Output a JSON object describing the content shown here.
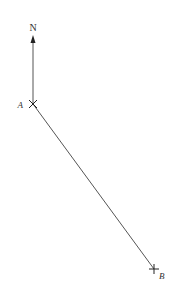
{
  "diagram": {
    "north_label": "N",
    "point_a_label": "A",
    "point_b_label": "B",
    "colors": {
      "line": "#444444",
      "background": "#ffffff"
    },
    "points": {
      "north_tip": [
        33,
        36
      ],
      "a": [
        33,
        104
      ],
      "b": [
        154,
        269
      ]
    }
  }
}
